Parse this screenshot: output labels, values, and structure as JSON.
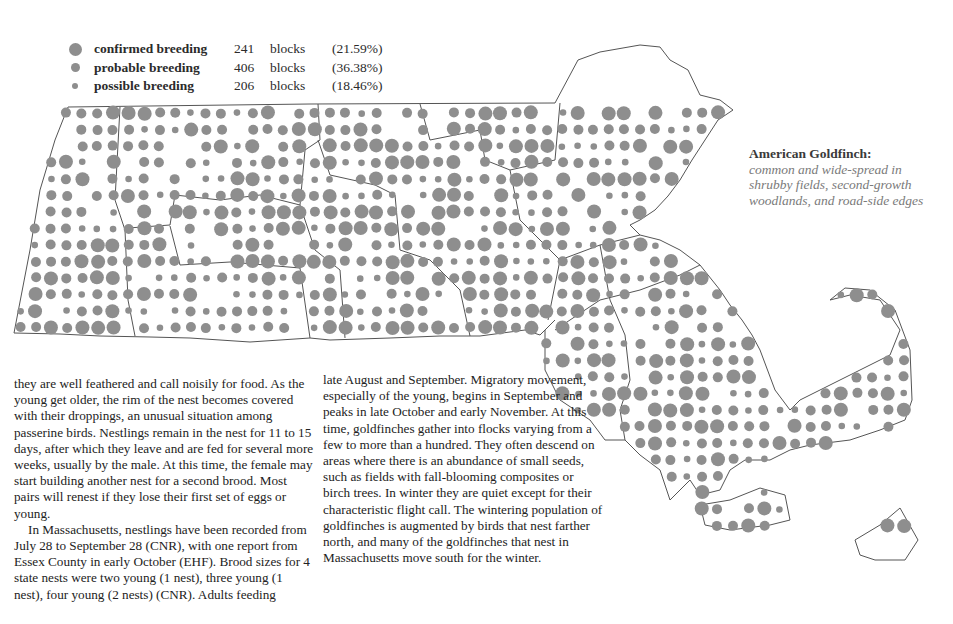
{
  "legend": {
    "items": [
      {
        "label": "confirmed breeding",
        "count": "241",
        "unit": "blocks",
        "percent": "(21.59%)",
        "dot_size": 13,
        "icon": "large-dot-icon"
      },
      {
        "label": "probable breeding",
        "count": "406",
        "unit": "blocks",
        "percent": "(36.38%)",
        "dot_size": 9,
        "icon": "medium-dot-icon"
      },
      {
        "label": "possible breeding",
        "count": "206",
        "unit": "blocks",
        "percent": "(18.46%)",
        "dot_size": 6,
        "icon": "small-dot-icon"
      }
    ]
  },
  "species": {
    "name": "American Goldfinch:",
    "description": "common and wide-spread in shrubby fields, second-growth woodlands, and road-side edges"
  },
  "text": {
    "column1_p1": "they are well feathered and call noisily for food. As the young get older, the rim of the nest becomes covered with their droppings, an unusual situation among passerine birds. Nestlings remain in the nest for 11 to 15 days, after which they leave and are fed for several more weeks, usually by the male. At this time, the female may start building another nest for a second brood. Most pairs will renest if they lose their first set of eggs or young.",
    "column1_p2": "In Massachusetts, nestlings have been recorded from July 28 to September 28 (CNR), with one report from Essex County in early October (EHF). Brood sizes for 4 state nests were two young (1 nest), three young (1 nest), four young (2 nests) (CNR). Adults feeding",
    "column2_p1": "late August and September. Migratory movement, especially of the young, begins in September and peaks in late October and early November. At this time, goldfinches gather into flocks varying from a few to more than a hundred. They often descend on areas where there is an abundance of small seeds, such as fields with fall-blooming composites or birch trees. In winter they are quiet except for their characteristic flight call. The wintering population of goldfinches is augmented by birds that nest farther north, and many of the goldfinches that nest in Massachusetts move south for the winter."
  },
  "map": {
    "dot_color": "#8e8e8e",
    "outline_color": "#555555",
    "region": "Massachusetts"
  }
}
